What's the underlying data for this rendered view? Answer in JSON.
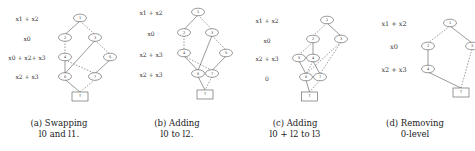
{
  "panels": [
    {
      "id": "a",
      "levels": [
        "x1 + x2",
        "x0",
        "x0 + x2+ x3",
        "x2 + x3"
      ],
      "caption_line1": "(a) Swapping",
      "caption_line2": "l0 and l1.",
      "nodes": [
        {
          "id": "1",
          "label": "1",
          "level": 0,
          "col": 1
        },
        {
          "id": "2",
          "label": "2",
          "level": 1,
          "col": 0
        },
        {
          "id": "3",
          "label": "3",
          "level": 1,
          "col": 2
        },
        {
          "id": "4",
          "label": "4",
          "level": 2,
          "col": 0
        },
        {
          "id": "5",
          "label": "5",
          "level": 2,
          "col": 3
        },
        {
          "id": "6",
          "label": "6",
          "level": 3,
          "col": 0
        },
        {
          "id": "7",
          "label": "7",
          "level": 3,
          "col": 2
        },
        {
          "id": "T",
          "label": "T",
          "level": 4,
          "col": 1,
          "terminal": true
        }
      ],
      "edges": [
        {
          "from": "1",
          "to": "2",
          "style": "solid"
        },
        {
          "from": "1",
          "to": "3",
          "style": "dashed"
        },
        {
          "from": "2",
          "to": "4",
          "style": "dashed"
        },
        {
          "from": "3",
          "to": "6",
          "style": "solid"
        },
        {
          "from": "3",
          "to": "5",
          "style": "dashed"
        },
        {
          "from": "4",
          "to": "6",
          "style": "solid"
        },
        {
          "from": "4",
          "to": "7",
          "style": "dashed"
        },
        {
          "from": "5",
          "to": "7",
          "style": "solid"
        },
        {
          "from": "6",
          "to": "T",
          "style": "solid"
        },
        {
          "from": "7",
          "to": "T",
          "style": "dashed"
        }
      ]
    },
    {
      "id": "b",
      "levels": [
        "x1 + x2",
        "x0",
        "x2 + x3",
        "x2 + x3"
      ],
      "caption_line1": "(b) Adding",
      "caption_line2": "l0 to l2.",
      "nodes": [
        {
          "id": "1",
          "label": "1",
          "level": 0,
          "col": 1
        },
        {
          "id": "2",
          "label": "2",
          "level": 1,
          "col": 0
        },
        {
          "id": "3",
          "label": "3",
          "level": 1,
          "col": 2
        },
        {
          "id": "4",
          "label": "4",
          "level": 2,
          "col": 0
        },
        {
          "id": "5",
          "label": "5",
          "level": 2,
          "col": 3
        },
        {
          "id": "6",
          "label": "6",
          "level": 3,
          "col": 1
        },
        {
          "id": "7",
          "label": "7",
          "level": 3,
          "col": 2
        },
        {
          "id": "T",
          "label": "T",
          "level": 4,
          "col": 1.5,
          "terminal": true
        }
      ],
      "edges": [
        {
          "from": "1",
          "to": "2",
          "style": "solid"
        },
        {
          "from": "1",
          "to": "3",
          "style": "dashed"
        },
        {
          "from": "2",
          "to": "4",
          "style": "dashed"
        },
        {
          "from": "3",
          "to": "6",
          "style": "solid"
        },
        {
          "from": "3",
          "to": "5",
          "style": "dashed"
        },
        {
          "from": "4",
          "to": "6",
          "style": "solid"
        },
        {
          "from": "4",
          "to": "7",
          "style": "dashed"
        },
        {
          "from": "5",
          "to": "7",
          "style": "solid"
        },
        {
          "from": "6",
          "to": "T",
          "style": "solid"
        },
        {
          "from": "7",
          "to": "T",
          "style": "dashed"
        }
      ]
    },
    {
      "id": "c",
      "levels": [
        "x1 + x2",
        "x0",
        "x2 + x3",
        "0"
      ],
      "caption_line1": "(c) Adding",
      "caption_line2": "l0 + l2 to l3",
      "nodes": [
        {
          "id": "1",
          "label": "1",
          "level": 0,
          "col": 2
        },
        {
          "id": "2",
          "label": "2",
          "level": 1,
          "col": 1
        },
        {
          "id": "3",
          "label": "3",
          "level": 1,
          "col": 3
        },
        {
          "id": "4",
          "label": "4",
          "level": 2,
          "col": 1
        },
        {
          "id": "5",
          "label": "5",
          "level": 2,
          "col": 0
        },
        {
          "id": "6",
          "label": "6",
          "level": 3,
          "col": 0.5
        },
        {
          "id": "7",
          "label": "7",
          "level": 3,
          "col": 1.5
        },
        {
          "id": "T",
          "label": "T",
          "level": 4,
          "col": 0.75,
          "terminal": true
        }
      ],
      "edges": [
        {
          "from": "1",
          "to": "2",
          "style": "dashed"
        },
        {
          "from": "1",
          "to": "3",
          "style": "solid"
        },
        {
          "from": "2",
          "to": "5",
          "style": "dashed"
        },
        {
          "from": "2",
          "to": "4",
          "style": "solid"
        },
        {
          "from": "3",
          "to": "6",
          "style": "dashed"
        },
        {
          "from": "3",
          "to": "7",
          "style": "dashed"
        },
        {
          "from": "5",
          "to": "6",
          "style": "solid"
        },
        {
          "from": "4",
          "to": "6",
          "style": "dashed"
        },
        {
          "from": "4",
          "to": "7",
          "style": "solid"
        },
        {
          "from": "6",
          "to": "T",
          "style": "solid"
        },
        {
          "from": "7",
          "to": "T",
          "style": "dashed"
        }
      ]
    },
    {
      "id": "d",
      "levels": [
        "x1 + x2",
        "x0",
        "x2 + x3"
      ],
      "caption_line1": "(d) Removing",
      "caption_line2": "0-level",
      "nodes": [
        {
          "id": "1",
          "label": "1",
          "level": 0,
          "col": 1
        },
        {
          "id": "2",
          "label": "2",
          "level": 1,
          "col": 0
        },
        {
          "id": "3",
          "label": "3",
          "level": 1,
          "col": 2
        },
        {
          "id": "4",
          "label": "4",
          "level": 2,
          "col": 0
        },
        {
          "id": "T",
          "label": "T",
          "level": 3,
          "col": 1.5,
          "terminal": true
        }
      ],
      "edges": [
        {
          "from": "1",
          "to": "2",
          "style": "dashed"
        },
        {
          "from": "1",
          "to": "3",
          "style": "solid"
        },
        {
          "from": "2",
          "to": "4",
          "style": "solid"
        },
        {
          "from": "4",
          "to": "T",
          "style": "solid"
        },
        {
          "from": "3",
          "to": "T",
          "style": "dashed"
        }
      ]
    }
  ]
}
